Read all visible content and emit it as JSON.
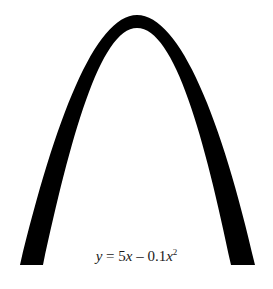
{
  "diagram": {
    "equation": {
      "y_var": "y",
      "equals": " = 5",
      "x_var1": "x",
      "minus": " – 0.1",
      "x_var2": "x",
      "exponent": "2",
      "full_text": "y = 5x – 0.1x²"
    },
    "arch": {
      "color": "#000000",
      "outer_path": "M 20 265 C 55 120, 95 15, 137 15 C 180 15, 222 120, 255 265",
      "inner_path": "M 231 265 C 205 140, 175 28, 137 28 C 100 28, 70 140, 43 265 Z"
    }
  }
}
